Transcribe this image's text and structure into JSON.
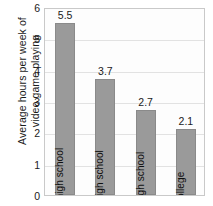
{
  "chart_data": {
    "type": "bar",
    "title": "",
    "xlabel": "",
    "ylabel": "Average hours per week of video game playing",
    "ylabel_lines": [
      "Average hours per week of",
      "video game playing"
    ],
    "categories": [
      "Junior high school",
      "Early high school",
      "Late high school",
      "College"
    ],
    "values": [
      5.5,
      3.7,
      2.7,
      2.1
    ],
    "value_labels": [
      "5.5",
      "3.7",
      "2.7",
      "2.1"
    ],
    "ylim": [
      0,
      6
    ],
    "yticks": [
      0,
      1,
      2,
      3,
      4,
      5,
      6
    ],
    "ytick_labels": [
      "0",
      "1",
      "2",
      "3",
      "4",
      "5",
      "6"
    ],
    "grid": true,
    "grid_axis": "y",
    "legend": false,
    "legend_position": "none",
    "bar_color": "#9a9a9a",
    "grid_color": "#e2e2e2",
    "frame_color": "#c9c9c9",
    "plot_background": "#fdfdfd"
  }
}
